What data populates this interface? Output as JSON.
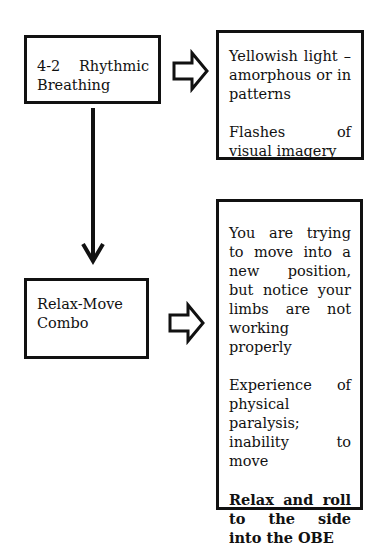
{
  "diagram": {
    "nodes": [
      {
        "id": "breathing",
        "label_line1_a": "4-2",
        "label_line1_b": "Rhythmic",
        "label_line2": "Breathing"
      },
      {
        "id": "breathing_effects",
        "paragraphs": [
          "Yellowish light – amorphous or in patterns",
          "Flashes of visual imagery"
        ]
      },
      {
        "id": "relax_move",
        "label": "Relax-Move Combo"
      },
      {
        "id": "relax_move_effects",
        "paragraphs": [
          "You are trying to move into a new position, but notice your limbs are not working properly",
          "Experience of physical paralysis; inability to move"
        ],
        "bold_paragraph": "Relax and roll to the side into the OBE"
      }
    ],
    "edges": [
      {
        "from": "breathing",
        "to": "breathing_effects",
        "style": "hollow-block-arrow"
      },
      {
        "from": "breathing",
        "to": "relax_move",
        "style": "solid-line-arrow"
      },
      {
        "from": "relax_move",
        "to": "relax_move_effects",
        "style": "hollow-block-arrow"
      }
    ]
  }
}
